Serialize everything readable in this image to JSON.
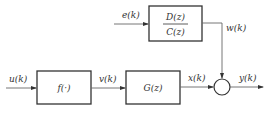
{
  "diagram": {
    "title": "",
    "blocks": {
      "noise_filter": {
        "numerator": "D(z)",
        "denominator": "C(z)"
      },
      "nonlinear": {
        "label": "f(·)"
      },
      "linear": {
        "label": "G(z)"
      }
    },
    "signals": {
      "noise_input": "e(k)",
      "noise_output": "w(k)",
      "input": "u(k)",
      "intermediate": "v(k)",
      "linear_output": "x(k)",
      "output": "y(k)"
    },
    "nodes": {
      "summing_junction": "sum"
    }
  }
}
